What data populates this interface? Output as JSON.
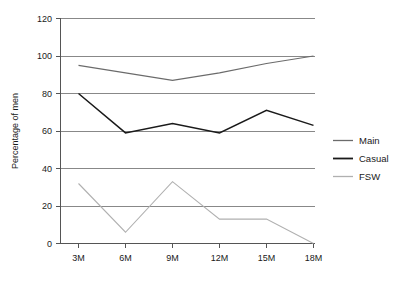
{
  "chart_data": {
    "type": "line",
    "title": "",
    "xlabel": "",
    "ylabel": "Percentage of men",
    "categories": [
      "3M",
      "6M",
      "9M",
      "12M",
      "15M",
      "18M"
    ],
    "ylim": [
      0,
      120
    ],
    "yticks": [
      0,
      20,
      40,
      60,
      80,
      100,
      120
    ],
    "ytick_labels": [
      "0",
      "20",
      "40",
      "60",
      "80",
      "100",
      "120"
    ],
    "grid": true,
    "legend_position": "right",
    "series": [
      {
        "name": "Main",
        "color": "#6b6b6b",
        "values": [
          95,
          91,
          87,
          91,
          96,
          100
        ]
      },
      {
        "name": "Casual",
        "color": "#1a1a1a",
        "values": [
          80,
          59,
          64,
          59,
          71,
          63
        ]
      },
      {
        "name": "FSW",
        "color": "#b0b0b0",
        "values": [
          32,
          6,
          33,
          13,
          13,
          0
        ]
      }
    ]
  },
  "axis": {
    "y_title": "Percentage of men",
    "tick_0": "0",
    "tick_20": "20",
    "tick_40": "40",
    "tick_60": "60",
    "tick_80": "80",
    "tick_100": "100",
    "tick_120": "120",
    "x_1": "3M",
    "x_2": "6M",
    "x_3": "9M",
    "x_4": "12M",
    "x_5": "15M",
    "x_6": "18M"
  },
  "legend": {
    "items": [
      {
        "label": "Main",
        "color": "#6b6b6b"
      },
      {
        "label": "Casual",
        "color": "#1a1a1a"
      },
      {
        "label": "FSW",
        "color": "#b0b0b0"
      }
    ]
  }
}
